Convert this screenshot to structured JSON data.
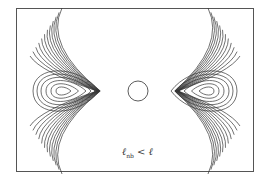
{
  "figure": {
    "type": "contour-diagram",
    "label": {
      "symbol": "ℓ",
      "subscript": "nb",
      "relation": " < ",
      "rhs": "ℓ"
    },
    "corner_tag": "",
    "colors": {
      "line": "#333333",
      "frame": "#555555",
      "background": "#ffffff"
    },
    "frame": {
      "x": 16,
      "y": 8,
      "width": 238,
      "height": 164
    },
    "center_circle": {
      "cx": 138,
      "cy": 91,
      "r": 10
    },
    "left_group": {
      "center_x": 62,
      "center_y": 91,
      "vertex_x": 97
    },
    "right_group": {
      "center_x": 208,
      "center_y": 91,
      "vertex_x": 178
    }
  }
}
